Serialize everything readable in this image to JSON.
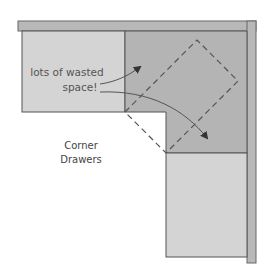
{
  "diagram": {
    "type": "kitchen-corner-cabinet-plan",
    "annotation": {
      "line1": "lots of wasted",
      "line2": "space!"
    },
    "label": {
      "line1": "Corner",
      "line2": "Drawers"
    },
    "colors": {
      "background": "#ffffff",
      "countertop": "#b8b8b8",
      "cabinet_light": "#d4d4d4",
      "cabinet_corner": "#b4b4b4",
      "outline": "#555555",
      "dashed": "#555555",
      "text": "#555555",
      "arrow": "#444444"
    }
  }
}
